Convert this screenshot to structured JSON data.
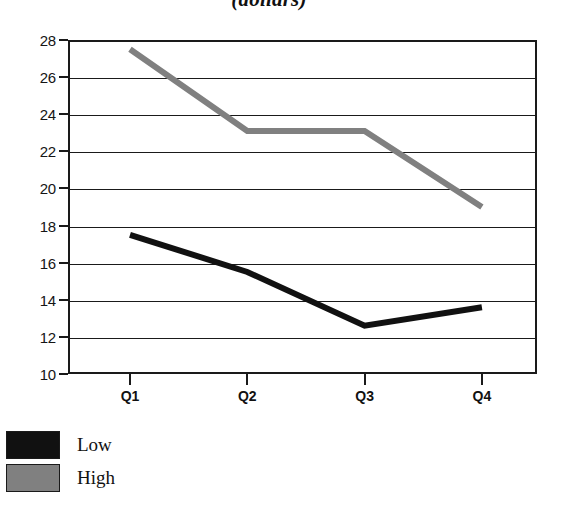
{
  "chart_data": {
    "type": "line",
    "title": "(dollars)",
    "xlabel": "",
    "ylabel": "",
    "categories": [
      "Q1",
      "Q2",
      "Q3",
      "Q4"
    ],
    "series": [
      {
        "name": "Low",
        "color": "#111111",
        "values": [
          17.5,
          15.5,
          12.6,
          13.6
        ]
      },
      {
        "name": "High",
        "color": "#808080",
        "values": [
          27.5,
          23.1,
          23.1,
          19.0
        ]
      }
    ],
    "ylim": [
      10,
      28
    ],
    "ytick_labels": [
      "28",
      "26",
      "24",
      "22",
      "20",
      "18",
      "16",
      "14",
      "12",
      "10"
    ],
    "yticks": [
      28,
      26,
      24,
      22,
      20,
      18,
      16,
      14,
      12,
      10
    ],
    "grid": true,
    "legend_position": "below-left"
  },
  "legend": {
    "entries": [
      {
        "label": "Low",
        "color": "#111111"
      },
      {
        "label": "High",
        "color": "#808080"
      }
    ]
  }
}
